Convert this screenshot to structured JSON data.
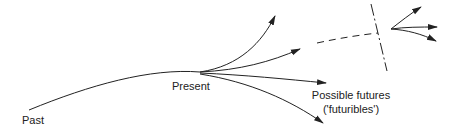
{
  "diagram": {
    "labels": {
      "past": "Past",
      "present": "Present",
      "futures_line1": "Possible futures",
      "futures_line2": "('futuribles')"
    },
    "colors": {
      "stroke": "#222222",
      "background": "#ffffff"
    }
  }
}
